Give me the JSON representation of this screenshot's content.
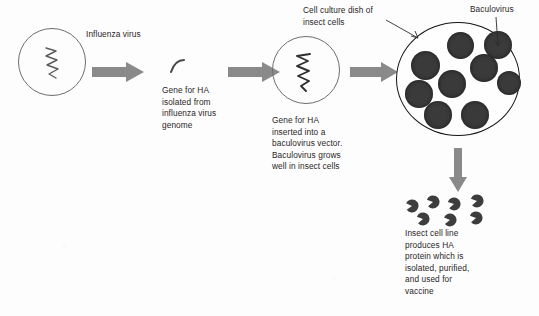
{
  "diagram": {
    "colors": {
      "background": "#fdfdfd",
      "arrow_gray": "#8a8a8a",
      "cell_dark": "#3a3a3a",
      "dish_outline": "#141414",
      "circle_outline": "#6e6e6e",
      "text": "#2a2626"
    },
    "labels": {
      "influenza_virus": "Influenza virus",
      "gene_isolated": "Gene for HA\nisolated from\ninfluenza virus\ngenome",
      "gene_inserted": "Gene for HA\ninserted into a\nbaculovirus vector.\nBaculovirus grows\nwell in insect cells",
      "cell_culture_dish": "Cell culture dish of\ninsect cells",
      "baculovirus": "Baculovirus",
      "insect_cell_line": "Insect cell line\nproduces HA\nprotein which is\nisolated, purified,\nand used for\nvaccine"
    },
    "shapes": {
      "influenza_particle_name": "influenza-virus-particle",
      "gene_fragment_name": "ha-gene-fragment",
      "baculovirus_particle_name": "baculovirus-vector-particle",
      "culture_dish_name": "insect-cell-culture-dish",
      "ha_protein_name": "ha-protein-molecule"
    },
    "cells": [
      {
        "x": 447,
        "y": 32,
        "d": 27
      },
      {
        "x": 484,
        "y": 31,
        "d": 28
      },
      {
        "x": 411,
        "y": 51,
        "d": 29
      },
      {
        "x": 470,
        "y": 54,
        "d": 28
      },
      {
        "x": 438,
        "y": 70,
        "d": 28
      },
      {
        "x": 405,
        "y": 80,
        "d": 28
      },
      {
        "x": 497,
        "y": 71,
        "d": 24
      },
      {
        "x": 424,
        "y": 101,
        "d": 28
      },
      {
        "x": 461,
        "y": 101,
        "d": 28
      }
    ],
    "ha_proteins": [
      {
        "x": 405,
        "y": 199,
        "r": 205
      },
      {
        "x": 426,
        "y": 195,
        "r": 200
      },
      {
        "x": 447,
        "y": 197,
        "r": 198
      },
      {
        "x": 470,
        "y": 194,
        "r": 200
      },
      {
        "x": 416,
        "y": 212,
        "r": 200
      },
      {
        "x": 443,
        "y": 213,
        "r": 203
      },
      {
        "x": 469,
        "y": 211,
        "r": 200
      }
    ],
    "arrows": [
      {
        "name": "arrow-virus-to-gene",
        "x": 92,
        "y": 62,
        "w": 52,
        "h": 20,
        "dir": "right"
      },
      {
        "name": "arrow-gene-to-vector",
        "x": 228,
        "y": 62,
        "w": 52,
        "h": 20,
        "dir": "right"
      },
      {
        "name": "arrow-vector-to-dish",
        "x": 350,
        "y": 62,
        "w": 48,
        "h": 20,
        "dir": "right"
      },
      {
        "name": "arrow-dish-to-protein",
        "x": 449,
        "y": 148,
        "w": 18,
        "h": 44,
        "dir": "down"
      }
    ]
  }
}
